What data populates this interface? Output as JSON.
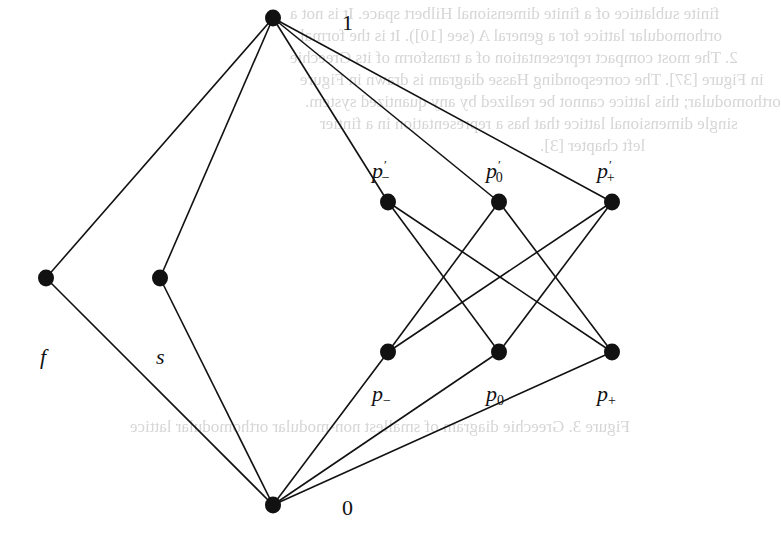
{
  "diagram": {
    "type": "hasse-diagram",
    "nodes": [
      {
        "id": "top",
        "label": "1",
        "x": 273,
        "y": 18
      },
      {
        "id": "f",
        "label": "f",
        "x": 46,
        "y": 278
      },
      {
        "id": "s",
        "label": "s",
        "x": 160,
        "y": 278
      },
      {
        "id": "pm_prime",
        "label": "p′−",
        "x": 388,
        "y": 202
      },
      {
        "id": "p0_prime",
        "label": "p′0",
        "x": 499,
        "y": 202
      },
      {
        "id": "pp_prime",
        "label": "p′+",
        "x": 612,
        "y": 202
      },
      {
        "id": "pm",
        "label": "p−",
        "x": 388,
        "y": 352
      },
      {
        "id": "p0",
        "label": "p0",
        "x": 499,
        "y": 352
      },
      {
        "id": "pp",
        "label": "p+",
        "x": 612,
        "y": 352
      },
      {
        "id": "bottom",
        "label": "0",
        "x": 273,
        "y": 505
      }
    ],
    "edges": [
      [
        "top",
        "f"
      ],
      [
        "top",
        "s"
      ],
      [
        "top",
        "pm_prime"
      ],
      [
        "top",
        "p0_prime"
      ],
      [
        "top",
        "pp_prime"
      ],
      [
        "f",
        "bottom"
      ],
      [
        "s",
        "bottom"
      ],
      [
        "pm",
        "bottom"
      ],
      [
        "p0",
        "bottom"
      ],
      [
        "pp",
        "bottom"
      ],
      [
        "pm_prime",
        "p0"
      ],
      [
        "pm_prime",
        "pp"
      ],
      [
        "p0_prime",
        "pm"
      ],
      [
        "p0_prime",
        "pp"
      ],
      [
        "pp_prime",
        "pm"
      ],
      [
        "pp_prime",
        "p0"
      ]
    ],
    "labels": {
      "top": "1",
      "bottom": "0",
      "f": "f",
      "s": "s",
      "pm_prime_base": "p",
      "pm_prime_sub": "−",
      "p0_prime_base": "p",
      "p0_prime_sub": "0",
      "pp_prime_base": "p",
      "pp_prime_sub": "+",
      "prime": "′",
      "pm_base": "p",
      "pm_sub": "−",
      "p0_base": "p",
      "p0_sub": "0",
      "pp_base": "p",
      "pp_sub": "+"
    },
    "colors": {
      "ink": "#111111",
      "background": "#ffffff",
      "bleed_through": "#d6d6d6"
    }
  },
  "bleed_through_text": [
    "finite sublattice of a finite dimensional Hilbert space. It is not a",
    "orthomodular lattice for a general A (see [10]). It is the formal",
    "2. The most compact representation of a transform of its Greechie",
    "in Figure [37]. The corresponding Hasse diagram is drawn in Figure",
    "orthomodular; this lattice cannot be realized by any quantized system.",
    "single dimensional lattice that has a representation in a fintier",
    "left chapter [3].",
    "Figure 3. Greechie diagram of smallest non-modular orthomodular lattice"
  ]
}
